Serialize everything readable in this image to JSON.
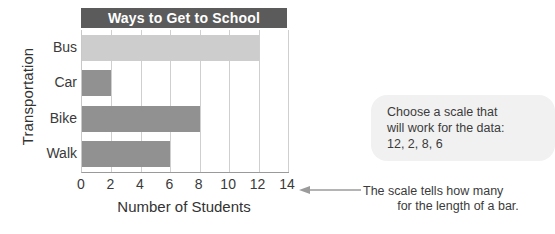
{
  "chart_data": {
    "type": "bar",
    "orientation": "horizontal",
    "title": "Ways to Get to School",
    "categories": [
      "Bus",
      "Car",
      "Bike",
      "Walk"
    ],
    "values": [
      12,
      2,
      8,
      6
    ],
    "xlabel": "Number of Students",
    "ylabel": "Transportation",
    "xlim": [
      0,
      14
    ],
    "xticks": [
      0,
      2,
      4,
      6,
      8,
      10,
      12,
      14
    ],
    "xtick_labels": [
      "0",
      "2",
      "4",
      "6",
      "8",
      "10",
      "12",
      "14"
    ],
    "grid": true,
    "legend": false,
    "bar_colors": [
      "#cdcdcd",
      "#919191",
      "#919191",
      "#919191"
    ],
    "title_bar_color": "#5b5b5b",
    "title_text_color": "#ffffff"
  },
  "callout": {
    "line1": "Choose a scale that",
    "line2": "will work for the data:",
    "line3": "12, 2, 8, 6",
    "background": "#f1f1f1"
  },
  "note": {
    "line1": "The scale tells how many",
    "line2": "for the length of a bar."
  },
  "icons": {
    "arrow": "left-arrow-icon"
  }
}
